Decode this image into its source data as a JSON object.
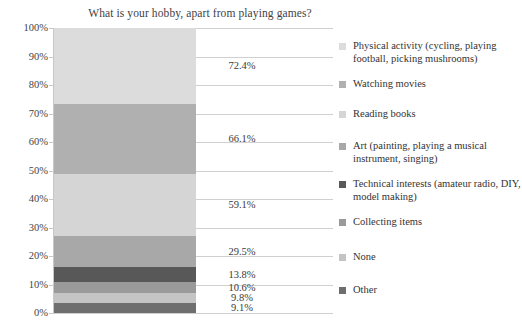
{
  "chart_data": {
    "type": "bar",
    "subtype": "stacked-bar-single-column",
    "title": "What is your hobby, apart from playing games?",
    "xlabel": "",
    "ylabel": "",
    "ylim": [
      0,
      100
    ],
    "grid": true,
    "legend_position": "right",
    "axis_tick_labels": [
      "100%",
      "90%",
      "80%",
      "70%",
      "60%",
      "50%",
      "40%",
      "30%",
      "20%",
      "10%",
      "0%"
    ],
    "categories": [
      "Physical activity (cycling, playing football, picking mushrooms)",
      "Watching movies",
      "Reading books",
      "Art (painting, playing a musical instrument, singing)",
      "Technical interests (amateur radio, DIY, model making)",
      "Collecting items",
      "None",
      "Other"
    ],
    "values": [
      72.4,
      66.1,
      59.1,
      29.5,
      13.8,
      10.6,
      9.8,
      9.1
    ],
    "value_labels": [
      "72.4%",
      "66.1%",
      "59.1%",
      "29.5%",
      "13.8%",
      "10.6%",
      "9.8%",
      "9.1%"
    ],
    "colors": [
      "#dcdcdc",
      "#b0b0b0",
      "#d5d5d5",
      "#a8a8a8",
      "#585858",
      "#9a9a9a",
      "#c4c4c4",
      "#6e6e6e"
    ],
    "segments": [
      {
        "label": "72.4%",
        "value": 72.4,
        "color": "#dcdcdc",
        "top_pct": 0.0,
        "height_pct": 26.78
      },
      {
        "label": "66.1%",
        "value": 66.1,
        "color": "#b0b0b0",
        "top_pct": 26.78,
        "height_pct": 24.45
      },
      {
        "label": "59.1%",
        "value": 59.1,
        "color": "#d5d5d5",
        "top_pct": 51.23,
        "height_pct": 21.86
      },
      {
        "label": "29.5%",
        "value": 29.5,
        "color": "#a8a8a8",
        "top_pct": 73.09,
        "height_pct": 10.91
      },
      {
        "label": "13.8%",
        "value": 13.8,
        "color": "#585858",
        "top_pct": 84.0,
        "height_pct": 5.1
      },
      {
        "label": "10.6%",
        "value": 10.6,
        "color": "#9a9a9a",
        "top_pct": 89.1,
        "height_pct": 3.92
      },
      {
        "label": "9.8%",
        "value": 9.8,
        "color": "#c4c4c4",
        "top_pct": 93.02,
        "height_pct": 3.62
      },
      {
        "label": "9.1%",
        "value": 9.1,
        "color": "#6e6e6e",
        "top_pct": 96.64,
        "height_pct": 3.36
      }
    ]
  },
  "legend": {
    "items": [
      {
        "label": "Physical activity (cycling, playing football, picking mushrooms)",
        "color": "#dcdcdc",
        "top": 0
      },
      {
        "label": "Watching movies",
        "color": "#b0b0b0",
        "top": 38
      },
      {
        "label": "Reading books",
        "color": "#d5d5d5",
        "top": 68
      },
      {
        "label": "Art (painting, playing a musical instrument, singing)",
        "color": "#a8a8a8",
        "top": 100
      },
      {
        "label": "Technical interests (amateur radio, DIY, model making)",
        "color": "#585858",
        "top": 138
      },
      {
        "label": "Collecting items",
        "color": "#9a9a9a",
        "top": 176
      },
      {
        "label": "None",
        "color": "#c4c4c4",
        "top": 211
      },
      {
        "label": "Other",
        "color": "#6e6e6e",
        "top": 244
      }
    ]
  },
  "axis": {
    "ticks": [
      {
        "label": "100%",
        "pos_pct": 0
      },
      {
        "label": "90%",
        "pos_pct": 10
      },
      {
        "label": "80%",
        "pos_pct": 20
      },
      {
        "label": "70%",
        "pos_pct": 30
      },
      {
        "label": "60%",
        "pos_pct": 40
      },
      {
        "label": "50%",
        "pos_pct": 50
      },
      {
        "label": "40%",
        "pos_pct": 60
      },
      {
        "label": "30%",
        "pos_pct": 70
      },
      {
        "label": "20%",
        "pos_pct": 80
      },
      {
        "label": "10%",
        "pos_pct": 90
      },
      {
        "label": "0%",
        "pos_pct": 100
      }
    ]
  }
}
